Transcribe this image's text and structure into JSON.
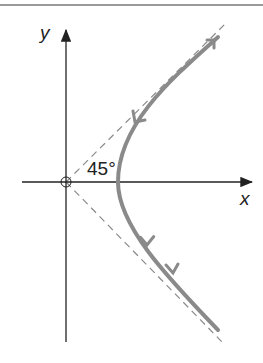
{
  "diagram": {
    "labels": {
      "x_axis": "x",
      "y_axis": "y",
      "angle": "45°"
    },
    "colors": {
      "curve": "#8a8a8a",
      "asymptote": "#8a8a8a",
      "axis": "#222222",
      "rule": "#9a9a9a"
    },
    "curve": {
      "type": "hyperbola-right-branch",
      "origin_px": [
        66,
        182
      ],
      "vertex_offset_px": 52,
      "arrows": [
        "down-along-branch"
      ]
    }
  }
}
